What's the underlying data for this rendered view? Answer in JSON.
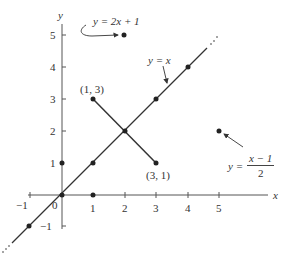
{
  "figure": {
    "axes": {
      "x_label": "x",
      "y_label": "y",
      "x_ticks": [
        "−1",
        "0",
        "1",
        "2",
        "3",
        "4",
        "5"
      ],
      "y_ticks": [
        "5",
        "4",
        "3",
        "2",
        "1",
        "−1"
      ],
      "origin_label": "0"
    },
    "labels": {
      "line_identity": "y = x",
      "line_double": "y = 2x + 1",
      "point_a": "(1, 3)",
      "point_b": "(3, 1)",
      "inverse_lhs": "y =",
      "inverse_num": "x − 1",
      "inverse_den": "2"
    },
    "points": [
      {
        "name": "origin",
        "x": 0,
        "y": 0
      },
      {
        "name": "y-axis-1",
        "x": 0,
        "y": 1
      },
      {
        "name": "x-axis-1",
        "x": 1,
        "y": 0
      },
      {
        "name": "diag-1",
        "x": 1,
        "y": 1
      },
      {
        "name": "diag-2",
        "x": 2,
        "y": 2
      },
      {
        "name": "diag-3",
        "x": 3,
        "y": 3
      },
      {
        "name": "diag-4",
        "x": 4,
        "y": 4
      },
      {
        "name": "diag-neg1",
        "x": -1,
        "y": -1
      },
      {
        "name": "point-1-3",
        "x": 1,
        "y": 3
      },
      {
        "name": "point-3-1",
        "x": 3,
        "y": 1
      },
      {
        "name": "point-2-5",
        "x": 2,
        "y": 5
      },
      {
        "name": "point-5-2",
        "x": 5,
        "y": 2
      }
    ],
    "colors": {
      "ink": "#333333",
      "axis": "#555555"
    }
  }
}
